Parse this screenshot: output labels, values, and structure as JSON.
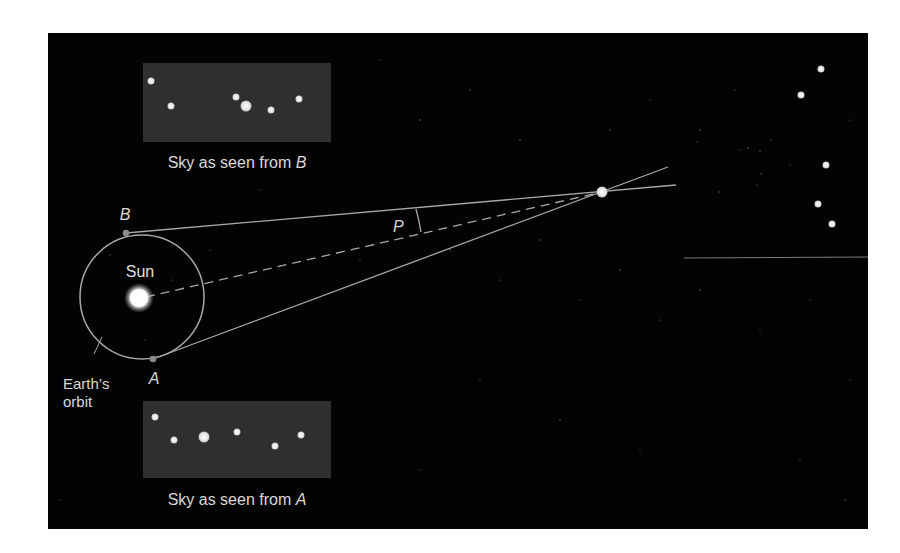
{
  "diagram": {
    "colors": {
      "background": "#ffffff",
      "space": "#030303",
      "sky_box": "#2f2f2f",
      "line": "#a8a8a8",
      "text": "#d8d8d8",
      "star": "#e8e8e8",
      "sun": "#ffffff"
    },
    "labels": {
      "sun": "Sun",
      "point_a": "A",
      "point_b": "B",
      "parallax_angle": "P",
      "orbit_line1": "Earth’s",
      "orbit_line2": "orbit",
      "sky_b_prefix": "Sky as seen from ",
      "sky_b_point": "B",
      "sky_a_prefix": "Sky as seen from ",
      "sky_a_point": "A"
    },
    "sky_b_stars": [
      {
        "x": 151,
        "y": 81,
        "r": 3.5
      },
      {
        "x": 171,
        "y": 106,
        "r": 3.5
      },
      {
        "x": 236,
        "y": 97,
        "r": 3.5
      },
      {
        "x": 246,
        "y": 106,
        "r": 5.5
      },
      {
        "x": 271,
        "y": 110,
        "r": 3.5
      },
      {
        "x": 299,
        "y": 99,
        "r": 3.5
      }
    ],
    "sky_a_stars": [
      {
        "x": 155,
        "y": 417,
        "r": 3.5
      },
      {
        "x": 174,
        "y": 440,
        "r": 3.5
      },
      {
        "x": 204,
        "y": 437,
        "r": 5.5
      },
      {
        "x": 237,
        "y": 432,
        "r": 3.5
      },
      {
        "x": 275,
        "y": 446,
        "r": 3.5
      },
      {
        "x": 301,
        "y": 435,
        "r": 3.5
      }
    ],
    "distant_stars": [
      {
        "x": 821,
        "y": 69,
        "r": 3.5
      },
      {
        "x": 801,
        "y": 95,
        "r": 3.5
      },
      {
        "x": 826,
        "y": 165,
        "r": 3.5
      },
      {
        "x": 818,
        "y": 204,
        "r": 3.5
      },
      {
        "x": 832,
        "y": 224,
        "r": 3.5
      }
    ],
    "nearby_star": {
      "x": 602,
      "y": 192,
      "r": 5.5
    }
  }
}
